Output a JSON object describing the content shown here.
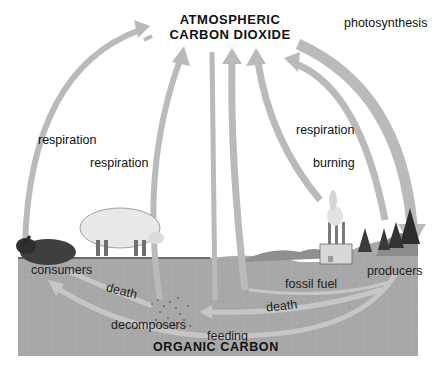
{
  "diagram": {
    "reservoirs": {
      "atmosphere": {
        "line1": "ATMOSPHERIC",
        "line2": "CARBON DIOXIDE"
      },
      "ground": "ORGANIC CARBON"
    },
    "sky_labels": {
      "respiration_left": "respiration",
      "respiration_center": "respiration",
      "respiration_right": "respiration",
      "burning": "burning",
      "photosynthesis": "photosynthesis"
    },
    "ground_labels": {
      "consumers": "consumers",
      "producers": "producers",
      "decomposers": "decomposers",
      "death_left": "death",
      "death_right": "death",
      "fossil_fuel": "fossil fuel",
      "feeding": "feeding"
    },
    "flows": [
      {
        "from": "consumers",
        "to": "ATMOSPHERIC CARBON DIOXIDE",
        "label": "respiration"
      },
      {
        "from": "decomposers",
        "to": "ATMOSPHERIC CARBON DIOXIDE",
        "label": "respiration"
      },
      {
        "from": "producers",
        "to": "ATMOSPHERIC CARBON DIOXIDE",
        "label": "respiration"
      },
      {
        "from": "fossil fuel",
        "to": "ATMOSPHERIC CARBON DIOXIDE",
        "label": "burning"
      },
      {
        "from": "ATMOSPHERIC CARBON DIOXIDE",
        "to": "producers",
        "label": "photosynthesis"
      },
      {
        "from": "consumers",
        "to": "decomposers",
        "label": "death"
      },
      {
        "from": "producers",
        "to": "decomposers",
        "label": "death"
      },
      {
        "from": "producers",
        "to": "fossil fuel",
        "label": "fossil fuel"
      },
      {
        "from": "producers",
        "to": "consumers",
        "label": "feeding"
      }
    ],
    "colors": {
      "arrow": "#b9b9b9",
      "ground": "#a9a9a9",
      "ground_arrow": "#c4c4c4",
      "text": "#111111"
    }
  }
}
